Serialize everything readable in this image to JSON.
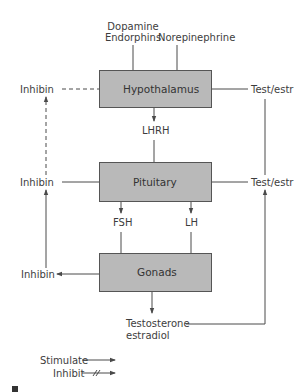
{
  "diagram": {
    "nodes": {
      "hypothalamus": "Hypothalamus",
      "pituitary": "Pituitary",
      "gonads": "Gonads"
    },
    "inputs": {
      "dopamine": "Dopamine",
      "endorphins": "Endorphins",
      "norepinephrine": "Norepinephrine"
    },
    "signals": {
      "lhrh": "LHRH",
      "fsh": "FSH",
      "lh": "LH",
      "inhibin_top": "Inhibin",
      "inhibin_mid": "Inhibin",
      "inhibin_bottom": "Inhibin",
      "test_estr_top": "Test/estr",
      "test_estr_mid": "Test/estr",
      "testosterone": "Testosterone",
      "estradiol": "estradiol"
    },
    "legend": {
      "stimulate": "Stimulate",
      "inhibit": "Inhibit"
    },
    "colors": {
      "box_fill": "#b9b9b9",
      "box_border": "#555555",
      "line": "#4a4a4a"
    }
  }
}
